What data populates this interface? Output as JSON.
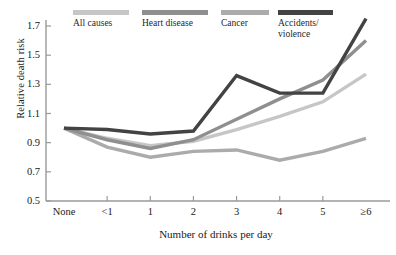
{
  "chart_data": {
    "type": "line",
    "title": "",
    "xlabel": "Number of drinks per day",
    "ylabel": "Relative death risk",
    "categories": [
      "None",
      "<1",
      "1",
      "2",
      "3",
      "4",
      "5",
      "≥6"
    ],
    "xtick_labels": [
      "None",
      "<1",
      "1",
      "2",
      "3",
      "4",
      "5",
      "≥6"
    ],
    "ytick_labels": [
      "1.7",
      "1.5",
      "1.3",
      "1.1",
      "0.9",
      "0.7",
      "0.5"
    ],
    "ytick_values": [
      1.7,
      1.5,
      1.3,
      1.1,
      0.9,
      0.7,
      0.5
    ],
    "ylim": [
      0.5,
      1.78
    ],
    "grid": false,
    "legend_position": "top",
    "series": [
      {
        "name": "All causes",
        "legend_label": "All causes",
        "color": "#c6c6c6",
        "values": [
          1.0,
          0.93,
          0.88,
          0.91,
          0.99,
          1.08,
          1.18,
          1.37
        ]
      },
      {
        "name": "Heart disease",
        "legend_label": "Heart disease",
        "color": "#8f8f8f",
        "values": [
          1.0,
          0.92,
          0.86,
          0.92,
          1.06,
          1.2,
          1.33,
          1.6
        ]
      },
      {
        "name": "Cancer",
        "legend_label": "Cancer",
        "color": "#ababab",
        "values": [
          1.0,
          0.87,
          0.8,
          0.84,
          0.85,
          0.78,
          0.84,
          0.93
        ]
      },
      {
        "name": "Accidents/violence",
        "legend_label": "Accidents/\nviolence",
        "color": "#434343",
        "values": [
          1.0,
          0.99,
          0.96,
          0.98,
          1.36,
          1.24,
          1.24,
          1.75
        ]
      }
    ]
  },
  "axes": {
    "y_axis_label": "Relative death risk",
    "x_axis_label": "Number of drinks per day"
  },
  "colors": {
    "axis": "#9a9a9a",
    "text": "#1a1a1a",
    "background": "#ffffff"
  }
}
